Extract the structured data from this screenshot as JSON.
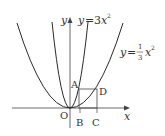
{
  "diagram": {
    "curves": [
      {
        "name": "steep-parabola",
        "equation_prefix": "y",
        "equals": "=",
        "coef": "3",
        "var": "x",
        "exp": "2"
      },
      {
        "name": "wide-parabola",
        "equation_prefix": "y",
        "equals": "=",
        "frac_num": "1",
        "frac_den": "3",
        "var": "x",
        "exp": "2"
      }
    ],
    "axes": {
      "x_label": "x",
      "y_label": "y",
      "origin_label": "O"
    },
    "points": {
      "A": "A",
      "B": "B",
      "C": "C",
      "D": "D"
    },
    "colors": {
      "stroke": "#2a2a2a",
      "text": "#333333"
    }
  }
}
